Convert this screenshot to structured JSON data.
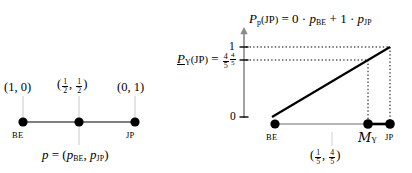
{
  "figure": {
    "title": "",
    "left_panel": {
      "name": "simplex-line-diagram",
      "node_labels": [
        "BE",
        "JP"
      ],
      "point_labels": [
        "(1, 0)",
        "(½, ½)",
        "(0, 1)"
      ],
      "point_label_parts": [
        {
          "open": "(",
          "a": "1",
          "sep": ",",
          "b": "0",
          "close": ")",
          "frac": false
        },
        {
          "open": "(",
          "a_num": "1",
          "a_den": "2",
          "sep": ",",
          "b_num": "1",
          "b_den": "2",
          "close": ")",
          "frac": true
        },
        {
          "open": "(",
          "a": "0",
          "sep": ",",
          "b": "1",
          "close": ")",
          "frac": false
        }
      ],
      "caption": "p = (p_BE, p_JP)",
      "caption_parts": {
        "p": "p",
        "eq": "=",
        "open": "(",
        "p1": "p",
        "p1sub": "BE",
        "comma": ",",
        "p2": "p",
        "p2sub": "JP",
        "close": ")"
      }
    },
    "right_panel": {
      "name": "probability-transfer-diagram",
      "top_formula": {
        "lhs_P": "P",
        "lhs_sub": "p",
        "lhs_arg": "(JP)",
        "eq": "=",
        "c1": "0",
        "dot1": "·",
        "t1_p": "p",
        "t1_sub": "BE",
        "plus": "+",
        "c2": "1",
        "dot2": "·",
        "t2_p": "p",
        "t2_sub": "JP"
      },
      "left_label": {
        "P": "P",
        "sub": "Y",
        "arg": "(JP)",
        "eq": "=",
        "value_num": "4",
        "value_den": "5"
      },
      "y_ticks": [
        {
          "label": "1",
          "frac": false,
          "value": 1
        },
        {
          "label": "4/5",
          "frac": true,
          "num": "4",
          "den": "5",
          "value": 0.8
        },
        {
          "label": "0",
          "frac": false,
          "value": 0
        }
      ],
      "node_labels": [
        "BE",
        "M_Y",
        "JP"
      ],
      "node_label_be": "BE",
      "node_label_my_m": "M",
      "node_label_my_sub": "Y",
      "node_label_jp": "JP",
      "bottom_caption": {
        "open": "(",
        "a_num": "1",
        "a_den": "5",
        "sep": ",",
        "b_num": "4",
        "b_den": "5",
        "close": ")"
      }
    },
    "colors": {
      "ink": "#000000",
      "guide": "#9a9a9a",
      "background": "#ffffff"
    }
  }
}
